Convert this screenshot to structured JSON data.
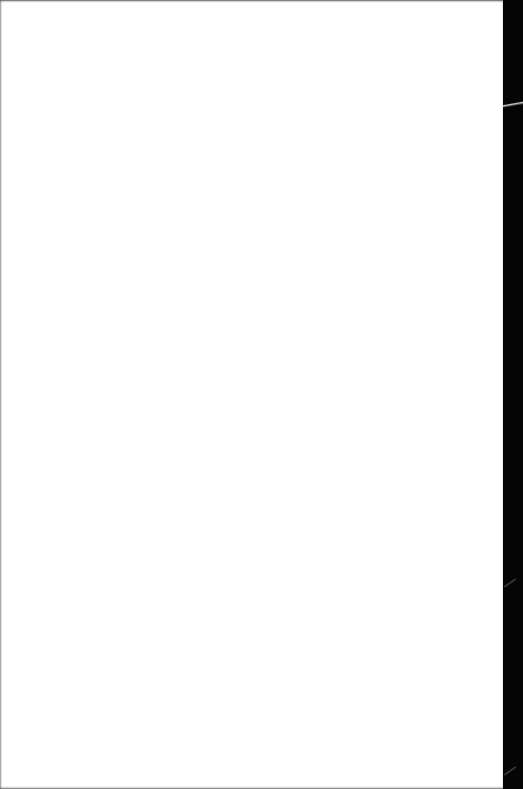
{
  "document": {
    "page_text": "",
    "background_color": "#ffffff",
    "edge_color": "#000000"
  }
}
